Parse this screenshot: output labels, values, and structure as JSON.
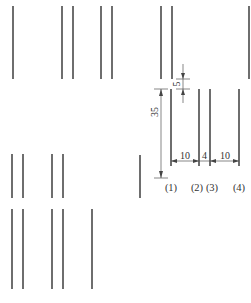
{
  "diagram": {
    "title": "",
    "line_color": "#4a4a4a",
    "background": "#ffffff",
    "top_row_lines_x": [
      13,
      62,
      73,
      101,
      112,
      161,
      173,
      250
    ],
    "lower_pair_lines_x": [
      12,
      23,
      52,
      63
    ],
    "bottom_row_lines_x": [
      12,
      23,
      52,
      63,
      92
    ],
    "detail": {
      "lines": [
        {
          "id": "1",
          "label": "(1)",
          "x": 171
        },
        {
          "id": "2",
          "label": "(2)",
          "x": 199
        },
        {
          "id": "3",
          "label": "(3)",
          "x": 210
        },
        {
          "id": "4",
          "label": "(4)",
          "x": 239
        }
      ],
      "dimensions": {
        "length": "35",
        "gap": "5",
        "spacing_1_2": "10",
        "spacing_2_3": "4",
        "spacing_3_4": "10"
      }
    }
  }
}
